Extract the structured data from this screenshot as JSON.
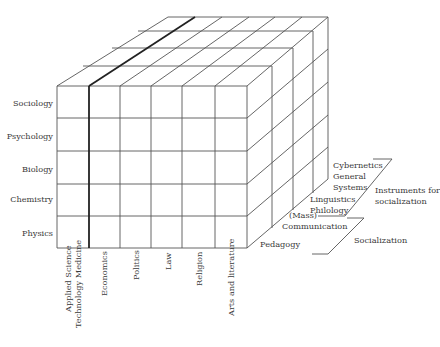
{
  "diagram": {
    "type": "3d-cube-matrix",
    "line_color": "#555555",
    "highlight_line_color": "#222222"
  },
  "rows": [
    {
      "label": "Sociology"
    },
    {
      "label": "Psychology"
    },
    {
      "label": "Biology"
    },
    {
      "label": "Chemistry"
    },
    {
      "label": "Physics"
    }
  ],
  "columns": [
    {
      "label_line1": "Applied Science",
      "label_line2": "Technology Medicine"
    },
    {
      "label_line1": "Economics"
    },
    {
      "label_line1": "Politics"
    },
    {
      "label_line1": "Law"
    },
    {
      "label_line1": "Religion"
    },
    {
      "label_line1": "Arts and literature"
    }
  ],
  "depth_layers": [
    {
      "label": "Pedagogy"
    },
    {
      "label_line1": "(Mass)",
      "label_line2": "Communication"
    },
    {
      "label_line1": "Linguistics",
      "label_line2": "Philology"
    },
    {
      "label_line1": "Cybernetics",
      "label_line2": "General",
      "label_line3": "Systems"
    }
  ],
  "groups": [
    {
      "label_line1": "Instruments for",
      "label_line2": "socialization"
    },
    {
      "label": "Socialization"
    }
  ]
}
